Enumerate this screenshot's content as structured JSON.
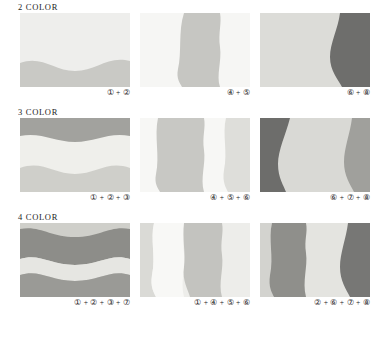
{
  "document": {
    "title": "Color Combination Swatch Chart",
    "rows": [
      {
        "heading": "2 COLOR",
        "panels": [
          {
            "caption": "① + ②",
            "orientation": "horizontal",
            "colors": [
              "#eeeeec",
              "#c9c9c5"
            ],
            "bands": [
              {
                "color": "#eeeeec",
                "shape": "top-wave"
              },
              {
                "color": "#c9c9c5",
                "shape": "bottom-wave"
              }
            ]
          },
          {
            "caption": "④ + ⑤",
            "orientation": "vertical",
            "colors": [
              "#f6f6f4",
              "#c6c6c2"
            ],
            "bands": [
              {
                "color": "#f6f6f4",
                "shape": "background"
              },
              {
                "color": "#c6c6c2",
                "shape": "center-band"
              }
            ]
          },
          {
            "caption": "⑥ + ⑧",
            "orientation": "vertical",
            "colors": [
              "#dcdcd8",
              "#6e6e6c"
            ],
            "bands": [
              {
                "color": "#dcdcd8",
                "shape": "background"
              },
              {
                "color": "#6e6e6c",
                "shape": "right-band"
              }
            ]
          }
        ]
      },
      {
        "heading": "3 COLOR",
        "panels": [
          {
            "caption": "① + ② + ③",
            "orientation": "horizontal",
            "colors": [
              "#a2a29e",
              "#efefeb",
              "#cfcfca"
            ],
            "bands": [
              {
                "color": "#a2a29e",
                "shape": "top-wave"
              },
              {
                "color": "#efefeb",
                "shape": "middle-wave"
              },
              {
                "color": "#cfcfca",
                "shape": "bottom-wave"
              }
            ]
          },
          {
            "caption": "④ + ⑤ + ⑥",
            "orientation": "vertical",
            "colors": [
              "#f7f7f5",
              "#c8c8c4",
              "#dedeDA"
            ],
            "bands": [
              {
                "color": "#f7f7f5",
                "shape": "background"
              },
              {
                "color": "#c8c8c4",
                "shape": "center-band"
              },
              {
                "color": "#dededa",
                "shape": "right-band"
              }
            ]
          },
          {
            "caption": "⑥ + ⑦ + ⑧",
            "orientation": "vertical",
            "colors": [
              "#6d6d6b",
              "#d9d9d5",
              "#a0a09c"
            ],
            "bands": [
              {
                "color": "#6d6d6b",
                "shape": "left-band"
              },
              {
                "color": "#d9d9d5",
                "shape": "center-band"
              },
              {
                "color": "#a0a09c",
                "shape": "right-band"
              }
            ]
          }
        ]
      },
      {
        "heading": "4 COLOR",
        "panels": [
          {
            "caption": "① + ② + ③ + ⑦",
            "orientation": "horizontal",
            "colors": [
              "#cfcfca",
              "#8d8d89",
              "#e6e6e2",
              "#9a9a96"
            ],
            "bands": [
              {
                "color": "#cfcfca",
                "shape": "top-wave"
              },
              {
                "color": "#8d8d89",
                "shape": "upper-middle-wave"
              },
              {
                "color": "#e6e6e2",
                "shape": "lower-middle-wave"
              },
              {
                "color": "#9a9a96",
                "shape": "bottom-wave"
              }
            ]
          },
          {
            "caption": "① + ④ + ⑤ + ⑥",
            "orientation": "vertical",
            "colors": [
              "#dadad6",
              "#f8f8f6",
              "#c3c3bf",
              "#ededea"
            ],
            "bands": [
              {
                "color": "#dadad6",
                "shape": "left-band"
              },
              {
                "color": "#f8f8f6",
                "shape": "inner-left-band"
              },
              {
                "color": "#c3c3bf",
                "shape": "center-band"
              },
              {
                "color": "#ededea",
                "shape": "right-band"
              }
            ]
          },
          {
            "caption": "② + ⑥ + ⑦ + ⑧",
            "orientation": "vertical",
            "colors": [
              "#d3d3cf",
              "#8f8f8b",
              "#e4e4e0",
              "#77777 5"
            ],
            "bands": [
              {
                "color": "#d3d3cf",
                "shape": "left-band"
              },
              {
                "color": "#8f8f8b",
                "shape": "inner-left-band"
              },
              {
                "color": "#e4e4e0",
                "shape": "center-band"
              },
              {
                "color": "#777775",
                "shape": "right-band"
              }
            ]
          }
        ]
      }
    ]
  }
}
